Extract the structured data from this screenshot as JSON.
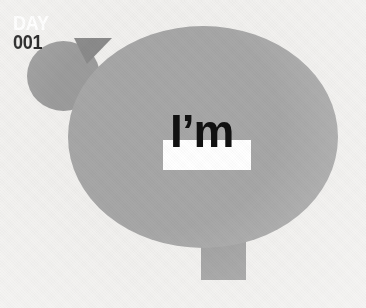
{
  "canvas": {
    "width": 366,
    "height": 308,
    "background_color": "#f1f0ee",
    "texture": "paper-canvas-weave"
  },
  "badge": {
    "shape": "circle",
    "fill_color": "#9c9c9c",
    "line_1": "DAY",
    "line_1_color": "#ffffff",
    "line_2": "001",
    "line_2_color": "#1c1c1c"
  },
  "speech_bubble": {
    "shape": "ellipse-with-rectangular-tail",
    "fill_color": "#a7a7a7",
    "tail_fill_color": "#a0a0a0",
    "shadow_color": "#8b8b8b"
  },
  "headline": {
    "text": "I’m",
    "text_color": "#111111",
    "highlight_color": "#ffffff"
  }
}
